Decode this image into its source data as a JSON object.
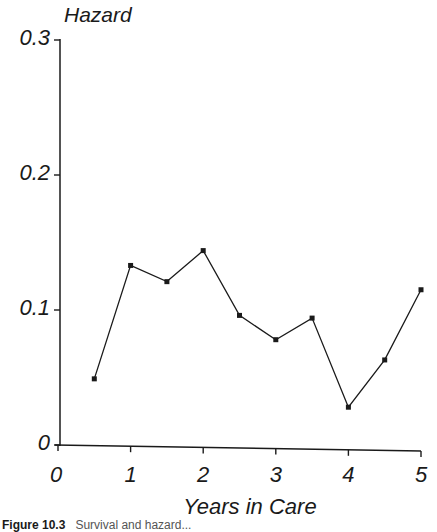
{
  "chart_data": {
    "type": "line",
    "title": "",
    "xlabel": "Years in Care",
    "ylabel": "Hazard",
    "x": [
      0.5,
      1.0,
      1.5,
      2.0,
      2.5,
      3.0,
      3.5,
      4.0,
      4.5,
      5.0
    ],
    "series": [
      {
        "name": "Hazard",
        "values": [
          0.049,
          0.133,
          0.121,
          0.144,
          0.096,
          0.078,
          0.094,
          0.028,
          0.063,
          0.115
        ]
      }
    ],
    "xlim": [
      0,
      5
    ],
    "ylim": [
      0,
      0.3
    ],
    "xticks": [
      "0",
      "1",
      "2",
      "3",
      "4",
      "5"
    ],
    "yticks": [
      "0",
      "0.1",
      "0.2",
      "0.3"
    ],
    "grid": false,
    "legend": "none",
    "markers": "small filled squares"
  },
  "caption": {
    "label": "Figure 10.3",
    "rest": "Survival and hazard..."
  },
  "colors": {
    "line": "#1a1a1a",
    "background": "#ffffff"
  }
}
